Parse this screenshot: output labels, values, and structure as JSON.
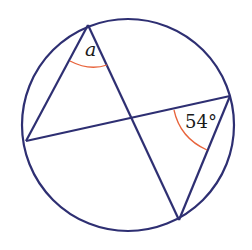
{
  "diagram": {
    "type": "circle-geometry",
    "colors": {
      "stroke": "#2e2f72",
      "arc": "#e8643c",
      "text": "#1a1a1a"
    },
    "circle": {
      "cx": 128,
      "cy": 125,
      "r": 106
    },
    "points": {
      "top": [
        88,
        25
      ],
      "left": [
        26,
        141
      ],
      "right": [
        230,
        96
      ],
      "bottom": [
        179,
        220
      ]
    },
    "labels": {
      "angle_a": "a",
      "angle_54": "54°"
    }
  }
}
